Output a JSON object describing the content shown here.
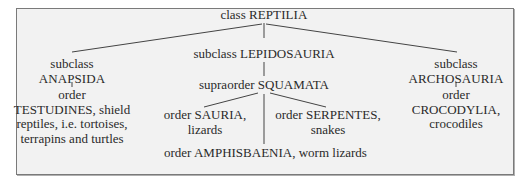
{
  "diagram": {
    "root": {
      "rank": "class",
      "name": "REPTILIA"
    },
    "anapsida": {
      "rank": "subclass",
      "name": "ANAPSIDA",
      "child": {
        "rank": "order",
        "lines": [
          "TESTUDINES, shield",
          "reptiles, i.e. tortoises,",
          "terrapins and turtles"
        ]
      }
    },
    "lepidosauria": {
      "label": "subclass LEPIDOSAURIA",
      "child": {
        "label": "supraorder SQUAMATA"
      }
    },
    "sauria": {
      "line1": "order SAURIA,",
      "line2": "lizards"
    },
    "serpentes": {
      "line1": "order SERPENTES,",
      "line2": "snakes"
    },
    "amphisbaenia": {
      "label": "order AMPHISBAENIA, worm lizards"
    },
    "archosauria": {
      "rank": "subclass",
      "name": "ARCHOSAURIA",
      "child": {
        "rank": "order",
        "line1": "CROCODYLIA,",
        "line2": "crocodiles"
      }
    },
    "line_color": "#444444"
  }
}
